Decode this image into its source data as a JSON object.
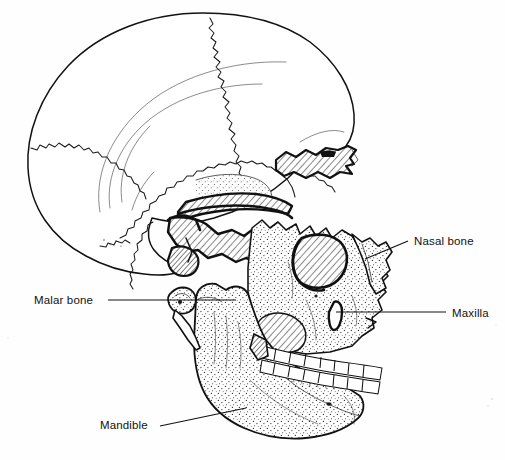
{
  "figure": {
    "kind": "anatomical-illustration",
    "orientation": "profile facing right",
    "background_color": "#fefefe",
    "ink_color": "#111111",
    "line_art": true,
    "width": 505,
    "height": 460
  },
  "labels": [
    {
      "id": "nasal-bone",
      "text": "Nasal bone",
      "text_x": 414,
      "text_y": 245,
      "anchor": "start",
      "leader": "M 365 259 L 408 241",
      "points_to": "bridge of the nose, upper nasal region"
    },
    {
      "id": "maxilla",
      "text": "Maxilla",
      "text_x": 452,
      "text_y": 317,
      "anchor": "start",
      "leader": "M 336 312 L 446 312",
      "points_to": "upper jaw bone above the upper teeth"
    },
    {
      "id": "malar-bone",
      "text": "Malar bone",
      "text_x": 34,
      "text_y": 304,
      "anchor": "start",
      "leader": "M 108 300 L 236 300",
      "points_to": "cheekbone / zygomatic region"
    },
    {
      "id": "mandible",
      "text": "Mandible",
      "text_x": 100,
      "text_y": 429,
      "anchor": "start",
      "leader": "M 160 426 L 246 408",
      "points_to": "lower jaw bone"
    }
  ],
  "regions": [
    {
      "id": "cranium",
      "name": "Cranial vault",
      "texture": "plain"
    },
    {
      "id": "frontal-bone",
      "name": "Frontal bone",
      "texture": "plain"
    },
    {
      "id": "parietal-bone",
      "name": "Parietal bone",
      "texture": "plain"
    },
    {
      "id": "occipital-bone",
      "name": "Occipital bone",
      "texture": "plain"
    },
    {
      "id": "temporal-bone",
      "name": "Temporal bone",
      "texture": "stipple"
    },
    {
      "id": "zygomatic-arch",
      "name": "Zygomatic arch",
      "texture": "hatch"
    },
    {
      "id": "maxilla-region",
      "name": "Maxilla",
      "texture": "stipple"
    },
    {
      "id": "nasal-region",
      "name": "Nasal bone",
      "texture": "stipple"
    },
    {
      "id": "orbit",
      "name": "Orbit (eye socket)",
      "texture": "hatch"
    },
    {
      "id": "mandible-region",
      "name": "Mandible",
      "texture": "stipple"
    }
  ],
  "teeth": {
    "upper_count": 8,
    "lower_count": 8
  }
}
